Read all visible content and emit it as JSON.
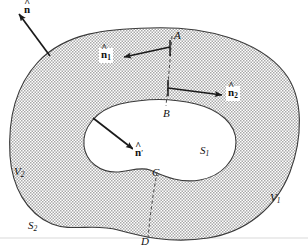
{
  "figure": {
    "background_color": "#ffffff",
    "shade_color": "#c9c9c9",
    "line_color": "#2a2a2a",
    "hole_fill": "#ffffff",
    "width": 308,
    "height": 249
  },
  "labels": {
    "n_outer": {
      "text": "n",
      "accent": "^",
      "sub": "",
      "prime": "",
      "x": 24,
      "y": 4,
      "boxed": false
    },
    "n1": {
      "text": "n",
      "accent": "^",
      "sub": "1",
      "prime": "",
      "x": 99,
      "y": 48,
      "boxed": true
    },
    "n2": {
      "text": "n",
      "accent": "^",
      "sub": "2",
      "prime": "",
      "x": 226,
      "y": 86,
      "boxed": true
    },
    "n_prime": {
      "text": "n",
      "accent": "^",
      "sub": "",
      "prime": "′",
      "x": 133,
      "y": 146,
      "boxed": true
    },
    "A": {
      "text": "A",
      "x": 174,
      "y": 30
    },
    "B": {
      "text": "B",
      "x": 163,
      "y": 108
    },
    "C": {
      "text": "C",
      "x": 152,
      "y": 167
    },
    "D": {
      "text": "D",
      "x": 141,
      "y": 236
    },
    "S1": {
      "text": "S",
      "sub": "1",
      "x": 200,
      "y": 145
    },
    "S2": {
      "text": "S",
      "sub": "2",
      "x": 28,
      "y": 220
    },
    "V1": {
      "text": "V",
      "sub": "1",
      "x": 270,
      "y": 192
    },
    "V2": {
      "text": "V",
      "sub": "2",
      "x": 14,
      "y": 166
    }
  },
  "geometry": {
    "outer_boundary": "M 150,28 C 205,26 258,40 284,72 C 305,98 302,140 290,172 C 276,208 246,232 208,238 C 170,244 140,236 118,230 C 94,223 72,232 52,224 C 26,213 12,186 10,156 C 8,122 14,88 38,62 C 66,32 108,29 150,28 Z",
    "hole_boundary": "M 120,104 C 146,98 172,98 196,104 C 220,110 236,124 236,142 C 236,160 222,176 200,180 C 178,184 160,174 150,170 C 140,166 128,172 116,172 C 100,172 86,162 84,146 C 82,128 96,110 120,104 Z",
    "cut_AB": "M 172,36 L 170,60 L 168,84 L 166,106",
    "cut_CD": "M 157,172 L 153,196 L 150,218 L 148,238",
    "arrow_n_outer": {
      "x1": 50,
      "y1": 56,
      "x2": 19,
      "y2": 14
    },
    "arrow_n1": {
      "x1": 170,
      "y1": 47,
      "x2": 124,
      "y2": 57
    },
    "arrow_n1_tail": {
      "x1": 170,
      "y1": 40,
      "x2": 170,
      "y2": 56
    },
    "arrow_n2": {
      "x1": 168,
      "y1": 88,
      "x2": 222,
      "y2": 95
    },
    "arrow_n2_tail": {
      "x1": 168,
      "y1": 80,
      "x2": 168,
      "y2": 96
    },
    "arrow_n_prime": {
      "x1": 93,
      "y1": 118,
      "x2": 133,
      "y2": 149
    },
    "baseline": {
      "x1": 0,
      "y1": 238,
      "x2": 308,
      "y2": 238
    }
  }
}
